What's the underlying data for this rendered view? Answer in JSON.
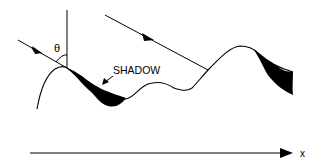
{
  "diagram": {
    "labels": {
      "angle": "θ",
      "shadow": "SHADOW",
      "axis": "x"
    },
    "elements": {
      "incident_rays": 2,
      "shadow_regions": 2,
      "surface": "rough undulating profile",
      "normal_line": "vertical reference line at surface peak"
    },
    "colors": {
      "ink": "#000000",
      "background": "#ffffff"
    }
  }
}
